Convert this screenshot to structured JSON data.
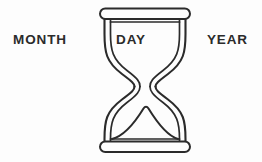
{
  "figure": {
    "background_color": "#fdfdfd",
    "stroke_color": "#2b2b2b",
    "icon": "hourglass-icon"
  },
  "labels": {
    "left": "MONTH",
    "center": "DAY",
    "right": "YEAR"
  }
}
